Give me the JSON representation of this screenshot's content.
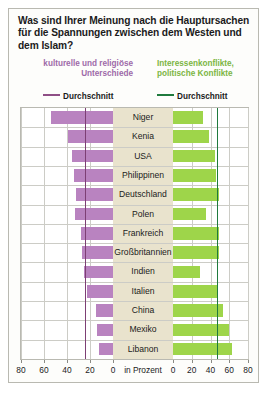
{
  "title": "Was sind Ihrer Meinung nach die Hauptursachen für die Spannungen zwischen dem Westen und dem Islam?",
  "legend": {
    "left_label": "kulturelle und religiöse Unterschiede",
    "right_label": "Interessenkonflikte, politische Konflikte",
    "left_avg_label": "Durchschnitt",
    "right_avg_label": "Durchschnitt",
    "left_color": "#b983c0",
    "right_color": "#9ed54a",
    "left_avg_color": "#7d3f74",
    "right_avg_color": "#1f7a3d"
  },
  "axis": {
    "unit": "in Prozent",
    "left_ticks": [
      80,
      60,
      40,
      20,
      0
    ],
    "right_ticks": [
      0,
      20,
      40,
      60,
      80
    ],
    "max": 80
  },
  "chart_data": {
    "type": "bar",
    "title": "Was sind Ihrer Meinung nach die Hauptursachen für die Spannungen zwischen dem Westen und dem Islam?",
    "orientation": "horizontal-diverging",
    "xlabel": "in Prozent",
    "ylabel": "",
    "xlim": [
      0,
      80
    ],
    "grid": true,
    "legend_position": "top",
    "categories": [
      "Niger",
      "Kenia",
      "USA",
      "Philippinen",
      "Deutschland",
      "Polen",
      "Frankreich",
      "Großbritannien",
      "Indien",
      "Italien",
      "China",
      "Mexiko",
      "Libanon"
    ],
    "series": [
      {
        "name": "kulturelle und religiöse Unterschiede",
        "color": "#b983c0",
        "side": "left",
        "average": 24,
        "values": [
          54,
          39,
          36,
          34,
          32,
          33,
          28,
          27,
          25,
          23,
          15,
          14,
          12
        ]
      },
      {
        "name": "Interessenkonflikte, politische Konflikte",
        "color": "#9ed54a",
        "side": "right",
        "average": 47,
        "values": [
          32,
          38,
          45,
          46,
          49,
          35,
          49,
          49,
          29,
          47,
          53,
          60,
          63
        ]
      }
    ]
  }
}
